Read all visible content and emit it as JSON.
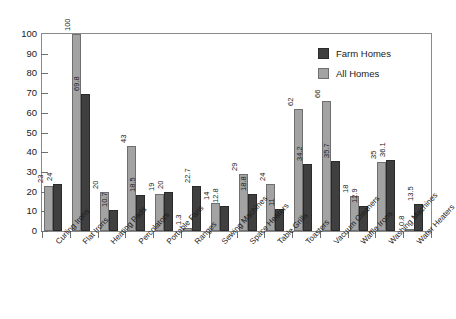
{
  "chart_data": {
    "type": "bar",
    "title": "",
    "xlabel": "",
    "ylabel": "",
    "ylim": [
      0,
      100
    ],
    "yticks": [
      0,
      10,
      20,
      30,
      40,
      50,
      60,
      70,
      80,
      90,
      100
    ],
    "grid": false,
    "legend_position": "top-right",
    "categories": [
      "Curling Irons",
      "Flat Irons",
      "Heating Pads",
      "Percolators",
      "Portable Fans",
      "Ranges",
      "Sewing Machines",
      "Space Heaters",
      "Table Grills",
      "Toasters",
      "Vacuum Cleaners",
      "Waffle Irons",
      "Washing Machines",
      "Water Heaters"
    ],
    "series": [
      {
        "name": "All Homes",
        "color": "#a3a3a3",
        "values": [
          23,
          100,
          20,
          43,
          19,
          1.3,
          14,
          29,
          24,
          62,
          66,
          18,
          35,
          0.8
        ]
      },
      {
        "name": "Farm Homes",
        "color": "#3f3f3f",
        "values": [
          24,
          69.8,
          10.7,
          18.5,
          20,
          22.7,
          12.8,
          18.8,
          11,
          34.2,
          35.7,
          12.9,
          36.1,
          13.5
        ]
      }
    ],
    "value_labels": {
      "all": [
        "23",
        "100",
        "20",
        "43",
        "19",
        "1.3",
        "14",
        "29",
        "24",
        "62",
        "66",
        "18",
        "35",
        "0.8"
      ],
      "farm": [
        "24",
        "69.8",
        "10.7",
        "18.5",
        "20",
        "22.7",
        "12.8",
        "18.8",
        "11",
        "34.2",
        "35.7",
        "12.9",
        "36.1",
        "13.5"
      ]
    }
  },
  "legend": {
    "entries": [
      {
        "label": "Farm Homes",
        "swatch": "farm"
      },
      {
        "label": "All Homes",
        "swatch": "all"
      }
    ]
  },
  "axis": {
    "y_tick_labels": [
      "100",
      "90",
      "80",
      "70",
      "60",
      "50",
      "40",
      "30",
      "20",
      "10",
      "0"
    ]
  }
}
